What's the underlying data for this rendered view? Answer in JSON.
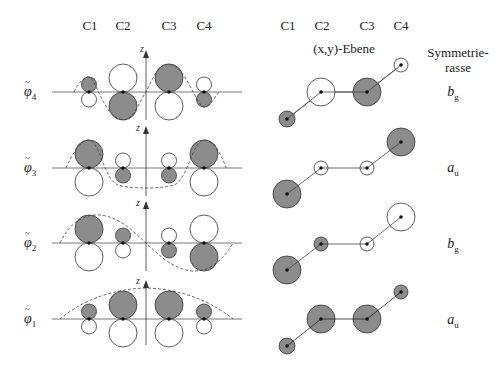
{
  "headers": {
    "left_columns": [
      "C1",
      "C2",
      "C3",
      "C4"
    ],
    "right_columns": [
      "C1",
      "C2",
      "C3",
      "C4"
    ],
    "plane_label": "(x,y)-Ebene",
    "symmetry_label_line1": "Symmetrie-",
    "symmetry_label_line2": "rasse",
    "axis_label": "z"
  },
  "orbitals": [
    {
      "label_base": "φ",
      "label_sub": "4",
      "symmetry_base": "b",
      "symmetry_sub": "g",
      "coeffs": [
        {
          "size": "small",
          "sign": "+"
        },
        {
          "size": "big",
          "sign": "-"
        },
        {
          "size": "big",
          "sign": "+"
        },
        {
          "size": "small",
          "sign": "-"
        }
      ]
    },
    {
      "label_base": "φ",
      "label_sub": "3",
      "symmetry_base": "a",
      "symmetry_sub": "u",
      "coeffs": [
        {
          "size": "big",
          "sign": "+"
        },
        {
          "size": "small",
          "sign": "-"
        },
        {
          "size": "small",
          "sign": "-"
        },
        {
          "size": "big",
          "sign": "+"
        }
      ]
    },
    {
      "label_base": "φ",
      "label_sub": "2",
      "symmetry_base": "b",
      "symmetry_sub": "g",
      "coeffs": [
        {
          "size": "big",
          "sign": "+"
        },
        {
          "size": "small",
          "sign": "+"
        },
        {
          "size": "small",
          "sign": "-"
        },
        {
          "size": "big",
          "sign": "-"
        }
      ]
    },
    {
      "label_base": "φ",
      "label_sub": "1",
      "symmetry_base": "a",
      "symmetry_sub": "u",
      "coeffs": [
        {
          "size": "small",
          "sign": "+"
        },
        {
          "size": "big",
          "sign": "+"
        },
        {
          "size": "big",
          "sign": "+"
        },
        {
          "size": "small",
          "sign": "+"
        }
      ]
    }
  ],
  "colors": {
    "filled": "#8c8c8c",
    "stroke": "#333333",
    "line": "#555555"
  }
}
